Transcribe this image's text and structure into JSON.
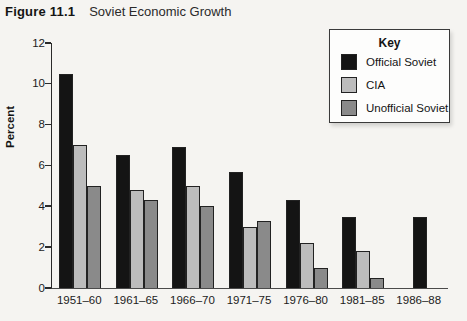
{
  "figure": {
    "label": "Figure 11.1",
    "title": "Soviet Economic Growth"
  },
  "legend": {
    "title": "Key"
  },
  "colors": {
    "background": "#f5f4f1",
    "axis": "#2a2a2a",
    "official_soviet": "#141414",
    "cia": "#bcbcbc",
    "unofficial_soviet": "#8a8a8a"
  },
  "chart_data": {
    "type": "bar",
    "title": "Soviet Economic Growth",
    "xlabel": "",
    "ylabel": "Percent",
    "ylim": [
      0,
      12
    ],
    "yticks": [
      0,
      2,
      4,
      6,
      8,
      10,
      12
    ],
    "grid": false,
    "legend_position": "top-right",
    "categories": [
      "1951–60",
      "1961–65",
      "1966–70",
      "1971–75",
      "1976–80",
      "1981–85",
      "1986–88"
    ],
    "series": [
      {
        "name": "Official Soviet",
        "color": "#141414",
        "values": [
          10.5,
          6.5,
          6.9,
          5.7,
          4.3,
          3.5,
          3.5
        ]
      },
      {
        "name": "CIA",
        "color": "#bcbcbc",
        "values": [
          7.0,
          4.8,
          5.0,
          3.0,
          2.2,
          1.8,
          null
        ]
      },
      {
        "name": "Unofficial Soviet",
        "color": "#8a8a8a",
        "values": [
          5.0,
          4.3,
          4.0,
          3.3,
          1.0,
          0.5,
          null
        ]
      }
    ]
  }
}
